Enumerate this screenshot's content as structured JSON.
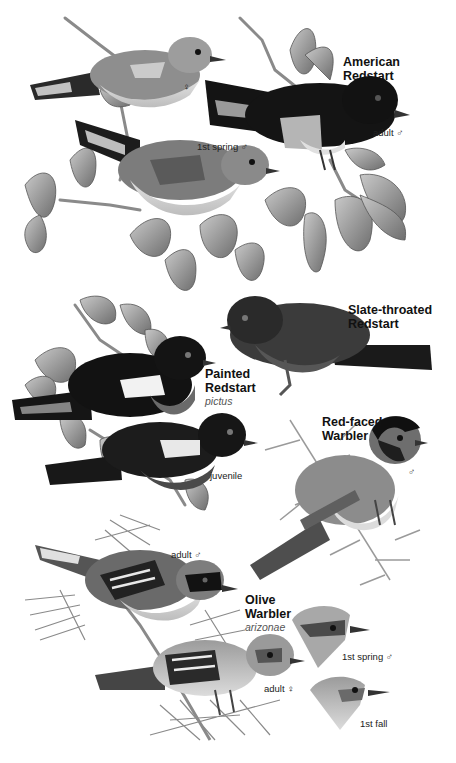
{
  "plate": {
    "colors": {
      "background": "#ffffff",
      "black_plumage": "#151515",
      "gray_plumage": "#7a7a7a",
      "light_plumage": "#d6d6d6",
      "foliage": "#9a9a9a",
      "text": "#111111"
    },
    "species": [
      {
        "name_line1": "American",
        "name_line2": "Redstart",
        "subspecies": "",
        "captions": [
          "♀",
          "1st spring ♂",
          "adult ♂"
        ]
      },
      {
        "name_line1": "Slate-throated",
        "name_line2": "Redstart",
        "subspecies": "",
        "captions": []
      },
      {
        "name_line1": "Painted",
        "name_line2": "Redstart",
        "subspecies": "pictus",
        "captions": [
          "juvenile"
        ]
      },
      {
        "name_line1": "Red-faced",
        "name_line2": "Warbler",
        "subspecies": "",
        "captions": [
          "♂"
        ]
      },
      {
        "name_line1": "Olive",
        "name_line2": "Warbler",
        "subspecies": "arizonae",
        "captions": [
          "adult ♂",
          "adult ♀",
          "1st spring ♂",
          "1st fall"
        ]
      }
    ]
  }
}
